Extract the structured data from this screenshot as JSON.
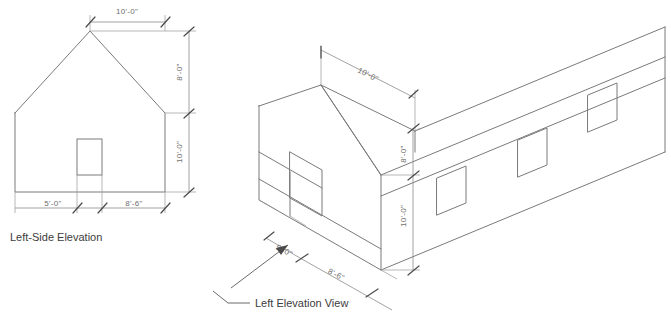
{
  "drawing": {
    "title_left": "Left-Side Elevation",
    "title_right": "Left Elevation View",
    "line_color": "#7a7a7a",
    "dim_color": "#8a8a8a",
    "text_color": "#6e6e6e",
    "caption_color": "#3c3c3c",
    "background": "#ffffff"
  },
  "left_elevation": {
    "label": "Left-Side Elevation",
    "dimensions": {
      "ridge_width": "10'-0\"",
      "roof_height": "8'-0\"",
      "wall_height": "10'-0\"",
      "window_offset": "5'-0\"",
      "window_to_corner": "8'-6\""
    }
  },
  "isometric_view": {
    "label": "Left Elevation View",
    "dimensions": {
      "ridge_width": "10'-0\"",
      "roof_height": "8'-0\"",
      "wall_height": "10'-0\"",
      "window_offset": "5'-0\"",
      "window_to_corner": "8'-6\""
    }
  }
}
